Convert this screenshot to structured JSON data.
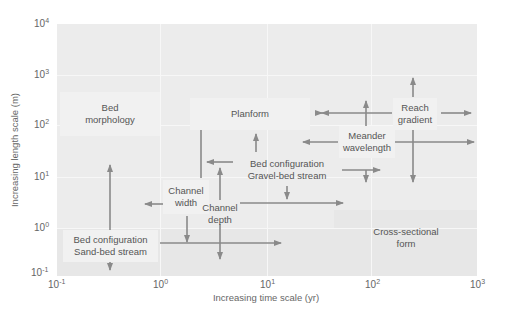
{
  "diagram": {
    "type": "log-log scale diagram of river channel features",
    "x_axis": {
      "label": "Increasing time scale (yr)",
      "ticks": [
        {
          "base": "10",
          "exp": "-1"
        },
        {
          "base": "10",
          "exp": "0"
        },
        {
          "base": "10",
          "exp": "1"
        },
        {
          "base": "10",
          "exp": "2"
        },
        {
          "base": "10",
          "exp": "3"
        }
      ]
    },
    "y_axis": {
      "label": "Increasing length scale (m)",
      "ticks": [
        {
          "base": "10",
          "exp": "4"
        },
        {
          "base": "10",
          "exp": "3"
        },
        {
          "base": "10",
          "exp": "2"
        },
        {
          "base": "10",
          "exp": "1"
        },
        {
          "base": "10",
          "exp": "0"
        },
        {
          "base": "10",
          "exp": "-1"
        }
      ]
    },
    "features": [
      {
        "id": "bed-morphology",
        "line1": "Bed",
        "line2": "morphology"
      },
      {
        "id": "planform",
        "line1": "Planform",
        "line2": ""
      },
      {
        "id": "reach-gradient",
        "line1": "Reach",
        "line2": "gradient"
      },
      {
        "id": "meander-wavelength",
        "line1": "Meander",
        "line2": "wavelength"
      },
      {
        "id": "bed-config-gravel",
        "line1": "Bed configuration",
        "line2": "Gravel-bed stream"
      },
      {
        "id": "channel-width",
        "line1": "Channel",
        "line2": "width"
      },
      {
        "id": "channel-depth",
        "line1": "Channel",
        "line2": "depth"
      },
      {
        "id": "bed-config-sand",
        "line1": "Bed configuration",
        "line2": "Sand-bed stream"
      },
      {
        "id": "cross-sectional-form",
        "line1": "Cross-sectional",
        "line2": "form"
      }
    ],
    "colors": {
      "plot_bg": "#ececec",
      "box_bg": "#f1f1f1",
      "arrow": "#8a8a8a",
      "text": "#555555"
    }
  }
}
